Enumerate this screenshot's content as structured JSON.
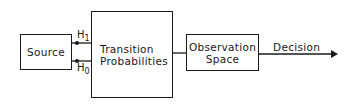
{
  "diagram": {
    "type": "block-diagram",
    "nodes": [
      {
        "id": "source",
        "label": "Source"
      },
      {
        "id": "transition",
        "label": "Transition\nProbabilities"
      },
      {
        "id": "observation",
        "label": "Observation\nSpace"
      }
    ],
    "edges": [
      {
        "from": "source",
        "to": "transition",
        "label": "H1"
      },
      {
        "from": "source",
        "to": "transition",
        "label": "H0"
      },
      {
        "from": "transition",
        "to": "observation",
        "label": ""
      },
      {
        "from": "observation",
        "to": "output",
        "label": "Decision"
      }
    ],
    "hypotheses": {
      "h1": {
        "base": "H",
        "sub": "1"
      },
      "h0": {
        "base": "H",
        "sub": "0"
      }
    },
    "output_label": "Decision",
    "colors": {
      "line": "#1a1a1a",
      "background": "#ffffff"
    }
  }
}
